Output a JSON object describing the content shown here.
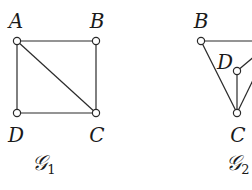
{
  "graphs": [
    {
      "id": "G1",
      "caption": {
        "script": "𝒢",
        "index": "1",
        "x": 44,
        "y": 164
      },
      "nodes": [
        {
          "name": "A",
          "x": 17,
          "y": 41,
          "label_x": 16,
          "label_y": 21
        },
        {
          "name": "B",
          "x": 96,
          "y": 41,
          "label_x": 97,
          "label_y": 21
        },
        {
          "name": "C",
          "x": 96,
          "y": 113,
          "label_x": 97,
          "label_y": 135
        },
        {
          "name": "D",
          "x": 17,
          "y": 113,
          "label_x": 16,
          "label_y": 135
        }
      ],
      "edges": [
        [
          "A",
          "B"
        ],
        [
          "A",
          "D"
        ],
        [
          "B",
          "C"
        ],
        [
          "D",
          "C"
        ],
        [
          "A",
          "C"
        ]
      ],
      "partial_edges": []
    },
    {
      "id": "G2",
      "caption": {
        "script": "𝒢",
        "index": "2",
        "x": 238,
        "y": 164
      },
      "nodes": [
        {
          "name": "B",
          "x": 201,
          "y": 41,
          "label_x": 201,
          "label_y": 21
        },
        {
          "name": "D",
          "x": 237,
          "y": 71,
          "label_x": 225,
          "label_y": 62
        },
        {
          "name": "C",
          "x": 237,
          "y": 113,
          "label_x": 238,
          "label_y": 135
        }
      ],
      "edges": [
        [
          "B",
          "C"
        ],
        [
          "D",
          "C"
        ]
      ],
      "partial_edges": [
        {
          "from": "B",
          "to_x": 256,
          "to_y": 41
        },
        {
          "from": "D",
          "to_x": 256,
          "to_y": 55
        },
        {
          "from": "C",
          "to_x": 256,
          "to_y": 74
        }
      ]
    }
  ],
  "style": {
    "stroke": "#2a2a2a",
    "node_radius": 3.6,
    "node_fill": "#ffffff"
  }
}
